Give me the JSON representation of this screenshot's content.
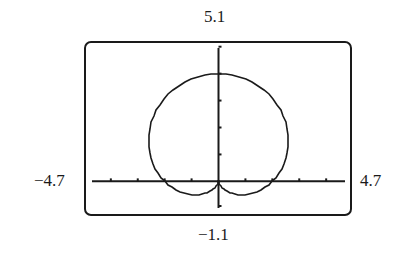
{
  "chart_data": {
    "type": "line",
    "title": "",
    "equation": "r = 2 + 2sin(theta)",
    "window": {
      "xmin": -4.7,
      "xmax": 4.7,
      "ymin": -1.1,
      "ymax": 5.1,
      "xscl": 1,
      "yscl": 1
    },
    "xlim": [
      -4.7,
      4.7
    ],
    "ylim": [
      -1.1,
      5.1
    ],
    "grid": false,
    "legend": null,
    "xlabel": "",
    "ylabel": "",
    "x_ticks": [
      -4,
      -3,
      -2,
      -1,
      1,
      2,
      3,
      4
    ],
    "y_ticks": [
      1,
      2,
      3,
      4,
      5
    ],
    "series": [
      {
        "name": "r = 2 + 2sin(theta)",
        "points_sampled": [
          {
            "x": 0,
            "y": 0
          },
          {
            "x": 2.6,
            "y": 1.5
          },
          {
            "x": 2,
            "y": 2
          },
          {
            "x": 0,
            "y": 4
          },
          {
            "x": -2,
            "y": 2
          },
          {
            "x": -2.6,
            "y": 1.5
          },
          {
            "x": -1.1,
            "y": -0.4
          },
          {
            "x": 1.1,
            "y": -0.4
          }
        ]
      }
    ]
  },
  "labels": {
    "ymax": "5.1",
    "ymin": "−1.1",
    "xmin": "−4.7",
    "xmax": "4.7"
  },
  "colors": {
    "ink": "#1a1a1a",
    "background": "#ffffff"
  }
}
